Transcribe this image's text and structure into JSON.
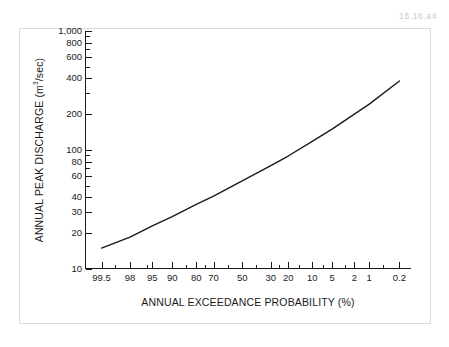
{
  "figure": {
    "id_label": "16.16.a4",
    "background_color": "#ffffff",
    "frame_color": "#d9dcdf",
    "axis_color": "#1a1a1a",
    "line_color": "#1a1a1a"
  },
  "chart_data": {
    "type": "line",
    "title": "",
    "subtitle": "",
    "xlabel": "ANNUAL EXCEEDANCE PROBABILITY (%)",
    "ylabel_parts": {
      "before": "ANNUAL PEAK DISCHARGE (m",
      "superscript": "3",
      "after": "/sec)"
    },
    "ylabel": "ANNUAL PEAK DISCHARGE (m3/sec)",
    "xscale": "probability",
    "yscale": "log",
    "x_reversed": true,
    "xlim": [
      99.8,
      0.1
    ],
    "ylim": [
      10,
      1000
    ],
    "grid": false,
    "legend": null,
    "x_tick_labels": [
      "99.5",
      "98",
      "95",
      "90",
      "80",
      "70",
      "50",
      "30",
      "20",
      "10",
      "5",
      "2",
      "1",
      "0.2"
    ],
    "x_tick_values": [
      99.5,
      98,
      95,
      90,
      80,
      70,
      50,
      30,
      20,
      10,
      5,
      2,
      1,
      0.2
    ],
    "x_minor_tick_values": [
      99,
      96,
      85,
      75,
      60,
      40,
      25,
      15,
      7,
      3,
      0.5
    ],
    "y_tick_labels": [
      "10",
      "20",
      "30",
      "40",
      "60",
      "80",
      "100",
      "200",
      "400",
      "600",
      "800",
      "1,000"
    ],
    "y_tick_values": [
      10,
      20,
      30,
      40,
      60,
      80,
      100,
      200,
      400,
      600,
      800,
      1000
    ],
    "y_minor_tick_values": [
      50,
      70,
      90,
      300,
      500,
      700,
      900
    ],
    "series": [
      {
        "name": "Flood frequency curve",
        "x": [
          99.5,
          98,
          95,
          90,
          80,
          70,
          50,
          30,
          20,
          10,
          5,
          2,
          1,
          0.2
        ],
        "y": [
          15,
          18.5,
          23,
          27.5,
          35,
          41,
          55,
          74,
          89,
          118,
          150,
          200,
          243,
          380
        ]
      }
    ],
    "annotations": []
  }
}
